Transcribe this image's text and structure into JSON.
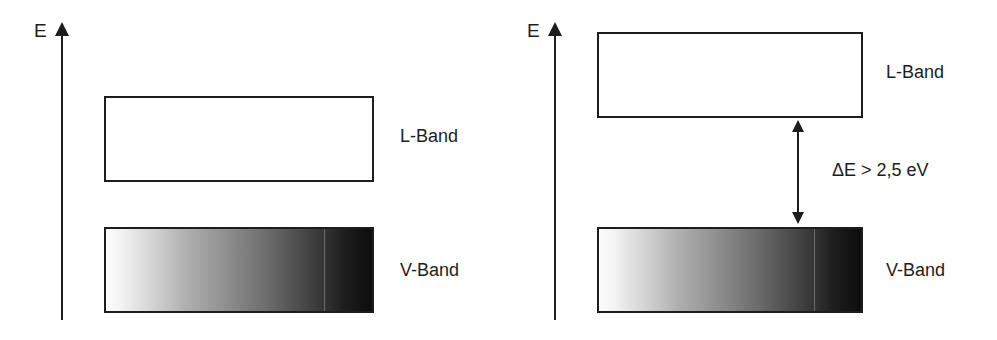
{
  "figure": {
    "type": "energy-band-diagram",
    "width": 997,
    "height": 340,
    "background": "#ffffff",
    "ink_color": "#1d1d1d"
  },
  "panels": [
    {
      "id": "left",
      "axis": {
        "label": "E"
      },
      "bands": [
        {
          "id": "conduction",
          "label": "L-Band",
          "fill": "empty"
        },
        {
          "id": "valence",
          "label": "V-Band",
          "fill": "gradient-light-to-dark"
        }
      ],
      "gap": {
        "shown": false
      }
    },
    {
      "id": "right",
      "axis": {
        "label": "E"
      },
      "bands": [
        {
          "id": "conduction",
          "label": "L-Band",
          "fill": "empty"
        },
        {
          "id": "valence",
          "label": "V-Band",
          "fill": "gradient-light-to-dark"
        }
      ],
      "gap": {
        "shown": true,
        "label": "ΔE  >  2,5 eV",
        "symbol": "ΔE",
        "relation": ">",
        "value": "2,5",
        "unit": "eV",
        "arrow": "double-headed-vertical"
      }
    }
  ],
  "gradient": {
    "stops": [
      {
        "pos": "0%",
        "color": "#fdfdfd"
      },
      {
        "pos": "18%",
        "color": "#d2d2d2"
      },
      {
        "pos": "46%",
        "color": "#8d8d8d"
      },
      {
        "pos": "72%",
        "color": "#4e4e4e"
      },
      {
        "pos": "100%",
        "color": "#0d0d0d"
      }
    ],
    "seam_at": "82%"
  }
}
